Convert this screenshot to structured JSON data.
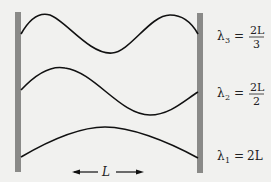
{
  "diagram": {
    "modes": [
      {
        "n": 3,
        "symbol": "λ",
        "subscript": "3",
        "equals": "=",
        "numerator": "2L",
        "denominator": "3"
      },
      {
        "n": 2,
        "symbol": "λ",
        "subscript": "2",
        "equals": "=",
        "numerator": "2L",
        "denominator": "2"
      },
      {
        "n": 1,
        "symbol": "λ",
        "subscript": "1",
        "equals": "=",
        "value": "2L"
      }
    ],
    "length_label": "L",
    "colors": {
      "wall": "#8a8a88",
      "wave": "#111111",
      "background": "#f1f1ef"
    }
  }
}
